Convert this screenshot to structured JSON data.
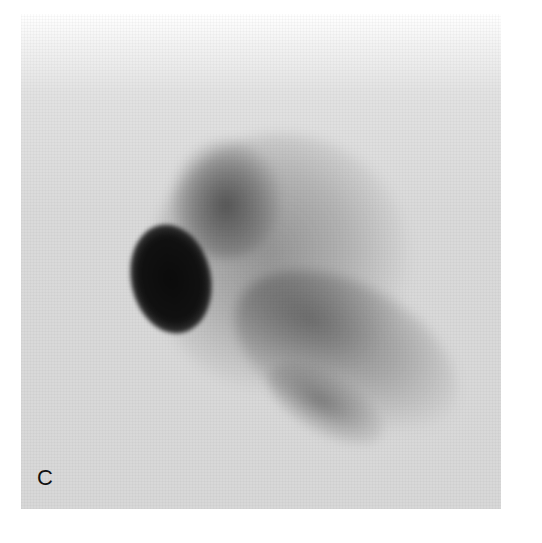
{
  "figure": {
    "panel_label": "C",
    "colors": {
      "background": "#d9d9d9",
      "hot_spot": "#0b0b0b",
      "diffuse_uptake": "#6e6e6e",
      "page": "#ffffff"
    }
  }
}
